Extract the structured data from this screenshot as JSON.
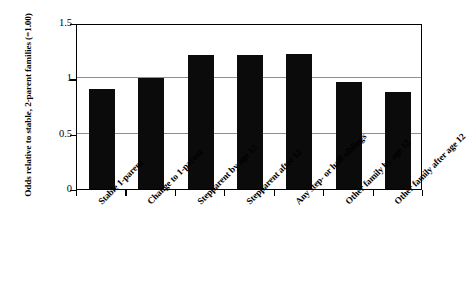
{
  "chart_data": {
    "type": "bar",
    "title": "",
    "subtitle": "",
    "xlabel": "",
    "ylabel": "Odds relative to stable, 2-parent families (=1.00)",
    "categories": [
      "Stable 1-parent",
      "Change to 1-parent",
      "Stepparent by age 12",
      "Stepparent after 12",
      "Any step- or half-siblings",
      "Other family by age 12",
      "Other family after age 12"
    ],
    "values": [
      0.9,
      1.0,
      1.21,
      1.21,
      1.22,
      0.97,
      0.88
    ],
    "ylim": [
      0,
      1.5
    ],
    "yticks": [
      "0",
      "0.5",
      "1",
      "1.5"
    ],
    "ytick_values": [
      0,
      0.5,
      1,
      1.5
    ],
    "grid": true,
    "legend": "none",
    "bar_color": "#0b0b0b",
    "gridline_color": "#8d8d8d",
    "axis_color": "#000000",
    "background_color": "#ffffff"
  }
}
